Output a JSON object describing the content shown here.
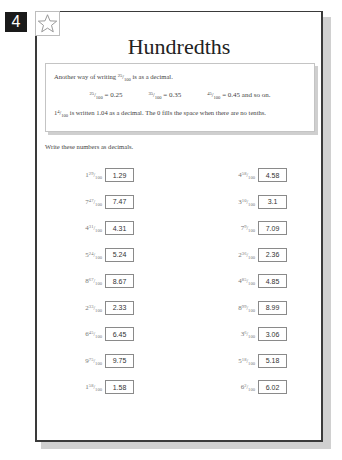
{
  "page": {
    "number": "4",
    "title": "Hundredths",
    "star_icon": "star-outline-icon"
  },
  "info": {
    "line1_before": "Another way of writing ",
    "line1_frac": {
      "whole": "",
      "num": "25",
      "den": "100"
    },
    "line1_after": " is as a decimal.",
    "examples": [
      {
        "num": "25",
        "den": "100",
        "value": " = 0.25",
        "suffix": ""
      },
      {
        "num": "35",
        "den": "100",
        "value": " = 0.35",
        "suffix": ""
      },
      {
        "num": "45",
        "den": "100",
        "value": " = 0.45",
        "suffix": " and so on."
      }
    ],
    "line3_frac": {
      "whole": "1",
      "num": "4",
      "den": "100"
    },
    "line3_after": " is written 1.04 as a decimal. The 0 fills the space when there are no tenths."
  },
  "instruction": "Write these numbers as decimals.",
  "questions": {
    "left": [
      {
        "whole": "1",
        "num": "29",
        "den": "100",
        "answer": "1.29"
      },
      {
        "whole": "7",
        "num": "47",
        "den": "100",
        "answer": "7.47"
      },
      {
        "whole": "4",
        "num": "31",
        "den": "100",
        "answer": "4.31"
      },
      {
        "whole": "5",
        "num": "24",
        "den": "100",
        "answer": "5.24"
      },
      {
        "whole": "8",
        "num": "67",
        "den": "100",
        "answer": "8.67"
      },
      {
        "whole": "2",
        "num": "33",
        "den": "100",
        "answer": "2.33"
      },
      {
        "whole": "6",
        "num": "45",
        "den": "100",
        "answer": "6.45"
      },
      {
        "whole": "9",
        "num": "75",
        "den": "100",
        "answer": "9.75"
      },
      {
        "whole": "1",
        "num": "58",
        "den": "100",
        "answer": "1.58"
      }
    ],
    "right": [
      {
        "whole": "4",
        "num": "58",
        "den": "100",
        "answer": "4.58"
      },
      {
        "whole": "3",
        "num": "10",
        "den": "100",
        "answer": "3.1"
      },
      {
        "whole": "7",
        "num": "9",
        "den": "100",
        "answer": "7.09"
      },
      {
        "whole": "2",
        "num": "36",
        "den": "100",
        "answer": "2.36"
      },
      {
        "whole": "4",
        "num": "85",
        "den": "100",
        "answer": "4.85"
      },
      {
        "whole": "8",
        "num": "99",
        "den": "100",
        "answer": "8.99"
      },
      {
        "whole": "3",
        "num": "6",
        "den": "100",
        "answer": "3.06"
      },
      {
        "whole": "5",
        "num": "18",
        "den": "100",
        "answer": "5.18"
      },
      {
        "whole": "6",
        "num": "2",
        "den": "100",
        "answer": "6.02"
      }
    ]
  }
}
